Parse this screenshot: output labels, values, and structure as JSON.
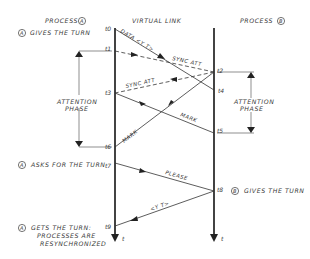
{
  "header": {
    "process_a": "PROCESS",
    "process_a_tag": "A",
    "virtual_link": "VIRTUAL LINK",
    "process_b": "PROCESS",
    "process_b_tag": "B"
  },
  "events": {
    "a_gives_turn": {
      "tag": "A",
      "text": "GIVES THE TURN"
    },
    "a_asks_turn": {
      "tag": "A",
      "text": "ASKS FOR THE TURN"
    },
    "b_gives_turn": {
      "tag": "B",
      "text": "GIVES THE TURN"
    },
    "a_gets_turn": {
      "tag": "A",
      "line1": "GETS THE TURN:",
      "line2": "PROCESSES ARE",
      "line3": "RESYNCHRONIZED"
    }
  },
  "phases": {
    "left": {
      "line1": "ATTENTION",
      "line2": "PHASE"
    },
    "right": {
      "line1": "ATTENTION",
      "line2": "PHASE"
    }
  },
  "times": {
    "t0": "t0",
    "t1": "t1",
    "t2": "t2",
    "t3": "t3",
    "t4": "t4",
    "t5": "t5",
    "t6": "t6",
    "t7": "t7",
    "t8": "t8",
    "t9": "t9",
    "axis_a": "t",
    "axis_b": "t"
  },
  "messages": {
    "data": "DATA <Y T>",
    "sync_att_ab": "SYNC ATT",
    "sync_att_ba": "SYNC ATT",
    "mark_ab": "MARK",
    "mark_ba": "MARK",
    "please": "PLEASE",
    "yt": "<Y T>"
  }
}
